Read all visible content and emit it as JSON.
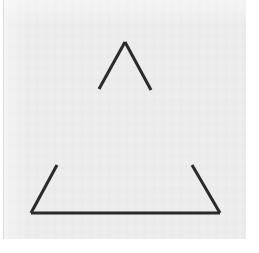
{
  "image": {
    "title": "Incomplete triangle figure",
    "description": "Three dark line segments on a light gray paper background forming an outlined triangle with gaps at each vertex",
    "width": 259,
    "height": 253
  },
  "canvas": {
    "page_background": "#ffffff",
    "panel_background": "#eeeeef",
    "panel_left": 4,
    "panel_top": 0,
    "panel_width": 242,
    "panel_height": 239,
    "left_rule_color": "#dcdcde"
  },
  "figure": {
    "name": "incomplete-triangle",
    "stroke_color": "#2a2a2c",
    "stroke_width": 3,
    "stroke_linecap": "butt",
    "segments": [
      {
        "name": "apex-left-leg",
        "x1": 95,
        "y1": 89,
        "x2": 121,
        "y2": 42
      },
      {
        "name": "apex-right-leg",
        "x1": 121,
        "y1": 42,
        "x2": 147,
        "y2": 90
      },
      {
        "name": "bottom-left-leg",
        "x1": 53,
        "y1": 165,
        "x2": 27,
        "y2": 213
      },
      {
        "name": "baseline",
        "x1": 27,
        "y1": 213,
        "x2": 216,
        "y2": 213
      },
      {
        "name": "bottom-right-leg",
        "x1": 216,
        "y1": 213,
        "x2": 188,
        "y2": 165
      }
    ]
  }
}
